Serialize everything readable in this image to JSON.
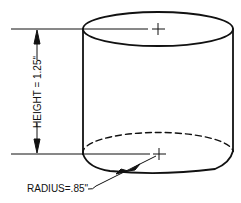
{
  "diagram": {
    "type": "technical-drawing",
    "height_label": "HEIGHT = 1.25\"",
    "radius_label": "RADIUS=.85\"",
    "line_color": "#111111",
    "background": "#ffffff"
  }
}
